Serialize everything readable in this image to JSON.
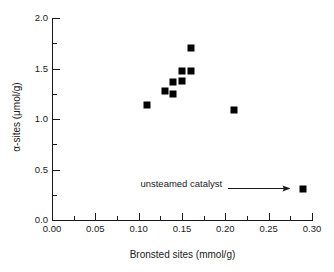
{
  "chart_data": {
    "type": "scatter",
    "title": "",
    "xlabel": "Bronsted sites (mmol/g)",
    "ylabel": "α-sites (μmol/g)",
    "xlim": [
      0.0,
      0.3
    ],
    "ylim": [
      0.0,
      2.0
    ],
    "grid": false,
    "legend": "none",
    "marker": {
      "shape": "square",
      "color": "#000000",
      "size_px": 7
    },
    "x_ticks": [
      {
        "value": 0.0,
        "label": "0.00",
        "major": true
      },
      {
        "value": 0.025,
        "label": "",
        "major": false
      },
      {
        "value": 0.05,
        "label": "0.05",
        "major": true
      },
      {
        "value": 0.075,
        "label": "",
        "major": false
      },
      {
        "value": 0.1,
        "label": "0.10",
        "major": true
      },
      {
        "value": 0.125,
        "label": "",
        "major": false
      },
      {
        "value": 0.15,
        "label": "0.15",
        "major": true
      },
      {
        "value": 0.175,
        "label": "",
        "major": false
      },
      {
        "value": 0.2,
        "label": "0.20",
        "major": true
      },
      {
        "value": 0.225,
        "label": "",
        "major": false
      },
      {
        "value": 0.25,
        "label": "0.25",
        "major": true
      },
      {
        "value": 0.275,
        "label": "",
        "major": false
      },
      {
        "value": 0.3,
        "label": "0.30",
        "major": true
      }
    ],
    "y_ticks": [
      {
        "value": 0.0,
        "label": "0.0",
        "major": true
      },
      {
        "value": 0.25,
        "label": "",
        "major": false
      },
      {
        "value": 0.5,
        "label": "0.5",
        "major": true
      },
      {
        "value": 0.75,
        "label": "",
        "major": false
      },
      {
        "value": 1.0,
        "label": "1.0",
        "major": true
      },
      {
        "value": 1.25,
        "label": "",
        "major": false
      },
      {
        "value": 1.5,
        "label": "1.5",
        "major": true
      },
      {
        "value": 1.75,
        "label": "",
        "major": false
      },
      {
        "value": 2.0,
        "label": "2.0",
        "major": true
      }
    ],
    "points": [
      {
        "x": 0.11,
        "y": 1.14
      },
      {
        "x": 0.13,
        "y": 1.28
      },
      {
        "x": 0.14,
        "y": 1.25
      },
      {
        "x": 0.14,
        "y": 1.37
      },
      {
        "x": 0.15,
        "y": 1.38
      },
      {
        "x": 0.15,
        "y": 1.48
      },
      {
        "x": 0.16,
        "y": 1.48
      },
      {
        "x": 0.16,
        "y": 1.7
      },
      {
        "x": 0.21,
        "y": 1.09
      },
      {
        "x": 0.29,
        "y": 0.31
      }
    ],
    "annotations": [
      {
        "text": "unsteamed catalyst",
        "text_x": 0.102,
        "text_y": 0.36,
        "arrow_from": {
          "x": 0.203,
          "y": 0.315
        },
        "arrow_to": {
          "x": 0.275,
          "y": 0.315
        }
      }
    ]
  },
  "colors": {
    "axis": "#1a1a1a",
    "marker": "#000000",
    "background": "#ffffff"
  }
}
